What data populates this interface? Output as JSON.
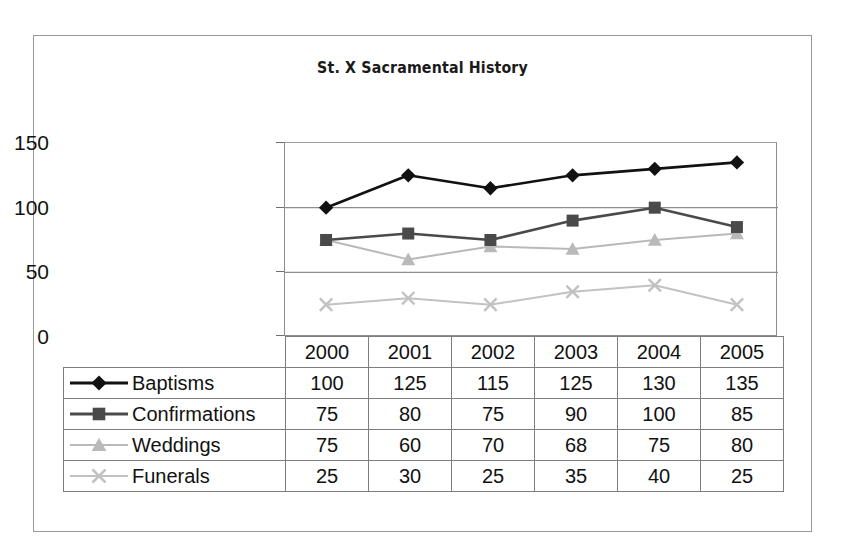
{
  "chart_data": {
    "type": "line",
    "title": "St. X Sacramental History",
    "xlabel": "",
    "ylabel": "",
    "categories": [
      "2000",
      "2001",
      "2002",
      "2003",
      "2004",
      "2005"
    ],
    "ylim": [
      0,
      150
    ],
    "yticks": [
      "0",
      "50",
      "100",
      "150"
    ],
    "ytick_values": [
      0,
      50,
      100,
      150
    ],
    "grid": true,
    "legend_position": "table-left-column",
    "series": [
      {
        "name": "Baptisms",
        "values": [
          100,
          125,
          115,
          125,
          130,
          135
        ],
        "marker": "diamond",
        "color": "#111111"
      },
      {
        "name": "Confirmations",
        "values": [
          75,
          80,
          75,
          90,
          100,
          85
        ],
        "marker": "square",
        "color": "#4a4a4a"
      },
      {
        "name": "Weddings",
        "values": [
          75,
          60,
          70,
          68,
          75,
          80
        ],
        "marker": "triangle",
        "color": "#b9b9b9"
      },
      {
        "name": "Funerals",
        "values": [
          25,
          30,
          25,
          35,
          40,
          25
        ],
        "marker": "x",
        "color": "#c2c2c2"
      }
    ]
  },
  "table": {
    "header_corner": "",
    "columns": [
      "2000",
      "2001",
      "2002",
      "2003",
      "2004",
      "2005"
    ],
    "rows": [
      {
        "label": "Baptisms",
        "marker": "diamond",
        "values": [
          "100",
          "125",
          "115",
          "125",
          "130",
          "135"
        ]
      },
      {
        "label": "Confirmations",
        "marker": "square",
        "values": [
          "75",
          "80",
          "75",
          "90",
          "100",
          "85"
        ]
      },
      {
        "label": "Weddings",
        "marker": "triangle",
        "values": [
          "75",
          "60",
          "70",
          "68",
          "75",
          "80"
        ]
      },
      {
        "label": "Funerals",
        "marker": "x",
        "values": [
          "25",
          "30",
          "25",
          "35",
          "40",
          "25"
        ]
      }
    ]
  },
  "axis": {
    "y_tick_0": "0",
    "y_tick_50": "50",
    "y_tick_100": "100",
    "y_tick_150": "150"
  },
  "colors": {
    "baptisms": "#111111",
    "confirmations": "#4a4a4a",
    "weddings": "#b9b9b9",
    "funerals": "#c2c2c2",
    "frame": "#9a9a9a",
    "grid": "#8d8d8d",
    "table_border": "#7d7d7d"
  }
}
